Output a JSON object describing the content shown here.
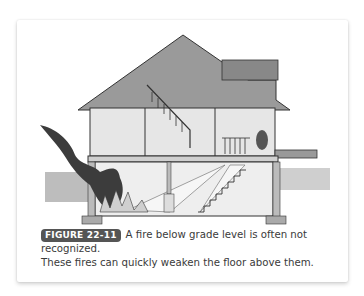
{
  "figure": {
    "label": "FIGURE 22-11",
    "caption_line1": "A fire below grade level is often not recognized.",
    "caption_line2": "These fires can quickly weaken the floor above them.",
    "illustration": "house-cross-section-basement-fire-icon"
  },
  "colors": {
    "badge_bg": "#555555",
    "roof": "#9a9a9a",
    "smoke": "#3c3c3c",
    "wall": "#e6e6e6"
  }
}
